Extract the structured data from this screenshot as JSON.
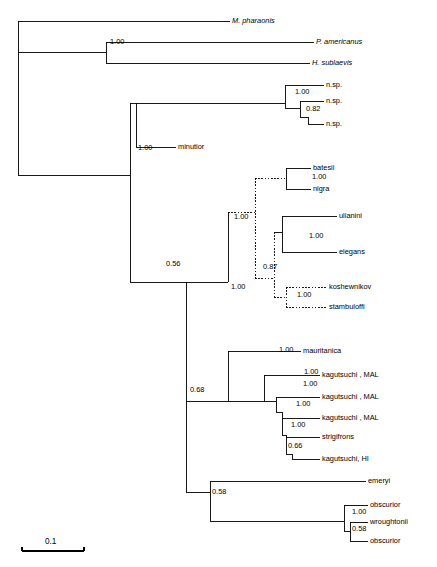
{
  "figure": {
    "type": "phylogenetic-tree",
    "title": "",
    "scale_bar": {
      "label": "0.1",
      "length_px": 62
    }
  },
  "taxa": [
    {
      "id": "t1",
      "label": "M. pharaonis",
      "italic": true,
      "x": 232,
      "y": 21
    },
    {
      "id": "t2",
      "label": "P. americanus",
      "italic": true,
      "x": 316,
      "y": 42
    },
    {
      "id": "t3",
      "label": "H. sublaevis",
      "italic": true,
      "x": 312,
      "y": 63
    },
    {
      "id": "t4",
      "label": "n.sp.",
      "italic": false,
      "x": 326,
      "y": 85
    },
    {
      "id": "t5",
      "label": "n.sp.",
      "italic": false,
      "x": 326,
      "y": 101
    },
    {
      "id": "t6",
      "label": "n.sp.",
      "italic": false,
      "x": 326,
      "y": 124
    },
    {
      "id": "t7",
      "label": "minutior",
      "italic": false,
      "x": 178,
      "y": 147
    },
    {
      "id": "t8",
      "label": "batesii",
      "italic": false,
      "x": 313,
      "y": 168
    },
    {
      "id": "t9",
      "label": "nigra",
      "italic": false,
      "x": 313,
      "y": 189
    },
    {
      "id": "t10",
      "label": "ulianini",
      "italic": false,
      "x": 339,
      "y": 216
    },
    {
      "id": "t11",
      "label": "elegans",
      "italic": false,
      "x": 339,
      "y": 252
    },
    {
      "id": "t12",
      "label": "koshewnikov",
      "italic": false,
      "x": 329,
      "y": 287
    },
    {
      "id": "t13",
      "label": "stambuloffi",
      "italic": false,
      "x": 329,
      "y": 307
    },
    {
      "id": "t14",
      "label": "mauritanica",
      "italic": false,
      "x": 303,
      "y": 351
    },
    {
      "id": "t15",
      "label": "kagutsuchi , MAL",
      "italic": false,
      "x": 322,
      "y": 375
    },
    {
      "id": "t16",
      "label": "kagutsuchi , MAL",
      "italic": false,
      "x": 322,
      "y": 397
    },
    {
      "id": "t17",
      "label": "kagutsuchi , MAL",
      "italic": false,
      "x": 322,
      "y": 418
    },
    {
      "id": "t18",
      "label": "strigifrons",
      "italic": false,
      "x": 322,
      "y": 437
    },
    {
      "id": "t19",
      "label": "kagutsuchi, HI",
      "italic": false,
      "x": 322,
      "y": 459
    },
    {
      "id": "t20",
      "label": "emeryi",
      "italic": false,
      "x": 368,
      "y": 481
    },
    {
      "id": "t21",
      "label": "obscurior",
      "italic": false,
      "x": 370,
      "y": 505
    },
    {
      "id": "t22",
      "label": "wroughtonii",
      "italic": false,
      "x": 370,
      "y": 522
    },
    {
      "id": "t23",
      "label": "obscurior",
      "italic": false,
      "x": 370,
      "y": 541
    }
  ],
  "support_values": [
    {
      "id": "s1",
      "value": "1.00",
      "x": 110,
      "y": 44
    },
    {
      "id": "s2",
      "value": "1.00",
      "x": 295,
      "y": 94
    },
    {
      "id": "s3",
      "value": "0.82",
      "x": 306,
      "y": 111
    },
    {
      "id": "s4",
      "value": "1.00",
      "x": 138,
      "y": 150
    },
    {
      "id": "s5",
      "value": "1.00",
      "x": 312,
      "y": 179
    },
    {
      "id": "s6",
      "value": "1.00",
      "x": 234,
      "y": 219
    },
    {
      "id": "s7",
      "value": "1.00",
      "x": 309,
      "y": 238
    },
    {
      "id": "s8",
      "value": "0.87",
      "x": 263,
      "y": 269
    },
    {
      "id": "s9",
      "value": "1.00",
      "x": 297,
      "y": 297
    },
    {
      "id": "s10",
      "value": "0.56",
      "x": 166,
      "y": 266
    },
    {
      "id": "s11",
      "value": "1.00",
      "x": 231,
      "y": 289
    },
    {
      "id": "s12",
      "value": "1.00",
      "x": 279,
      "y": 352
    },
    {
      "id": "s13",
      "value": "1.00",
      "x": 304,
      "y": 374
    },
    {
      "id": "s14",
      "value": "1.00",
      "x": 303,
      "y": 386
    },
    {
      "id": "s15",
      "value": "1.00",
      "x": 296,
      "y": 406
    },
    {
      "id": "s16",
      "value": "1.00",
      "x": 291,
      "y": 427
    },
    {
      "id": "s17",
      "value": "0.66",
      "x": 288,
      "y": 448
    },
    {
      "id": "s18",
      "value": "0.68",
      "x": 190,
      "y": 392
    },
    {
      "id": "s19",
      "value": "0.58",
      "x": 212,
      "y": 494
    },
    {
      "id": "s20",
      "value": "1.00",
      "x": 352,
      "y": 514
    },
    {
      "id": "s21",
      "value": "0.58",
      "x": 352,
      "y": 531
    }
  ]
}
